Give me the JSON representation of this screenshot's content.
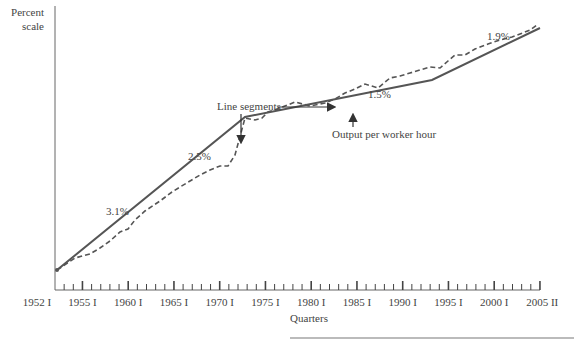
{
  "chart_data": {
    "type": "line",
    "title": "",
    "ylabel": "Percent scale",
    "xlabel": "Quarters",
    "x_ticks": [
      "1952 I",
      "1955 I",
      "1960 I",
      "1965 I",
      "1970 I",
      "1975 I",
      "1980 I",
      "1985 I",
      "1990 I",
      "1995 I",
      "2000 I",
      "2005 II"
    ],
    "x_tick_years": [
      1952,
      1955,
      1960,
      1965,
      1970,
      1975,
      1980,
      1985,
      1990,
      1995,
      2000,
      2005.25
    ],
    "grid": false,
    "legend": "annotations",
    "series": [
      {
        "name": "Line segments",
        "style": "solid",
        "points": [
          [
            1952,
            0
          ],
          [
            1973,
            1
          ],
          [
            1995,
            2
          ],
          [
            2005.25,
            3
          ]
        ],
        "segment_growth_labels": [
          "3.1%",
          "2.5%",
          "1.5%",
          "1.9%"
        ]
      },
      {
        "name": "Output per worker hour",
        "style": "dashed"
      }
    ],
    "annotations": [
      {
        "text": "3.1%"
      },
      {
        "text": "2.5%"
      },
      {
        "text": "1.5%"
      },
      {
        "text": "1.9%"
      },
      {
        "text": "Line segments"
      },
      {
        "text": "Output per worker hour"
      }
    ]
  },
  "axis": {
    "ylabel_line1": "Percent",
    "ylabel_line2": "scale",
    "xlabel": "Quarters",
    "ticks": [
      "1952 I",
      "1955 I",
      "1960 I",
      "1965 I",
      "1970 I",
      "1975 I",
      "1980 I",
      "1985 I",
      "1990 I",
      "1995 I",
      "2000 I",
      "2005 II"
    ]
  },
  "labels": {
    "g1": "3.1%",
    "g2": "2.5%",
    "g3": "1.5%",
    "g4": "1.9%",
    "line_segments": "Line segments",
    "output": "Output per worker hour"
  }
}
